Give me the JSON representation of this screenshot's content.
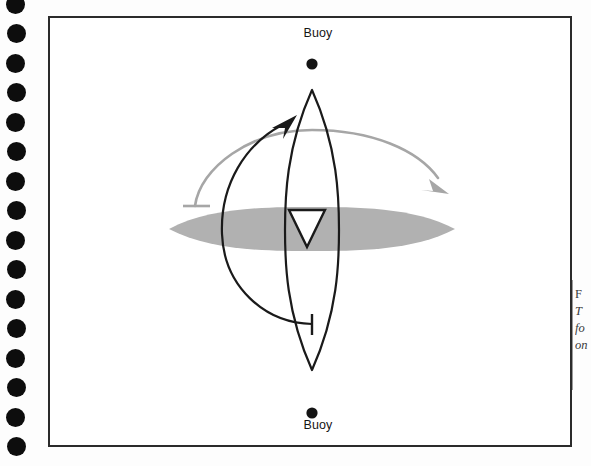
{
  "page": {
    "background_color": "#fdfdfd",
    "binding": {
      "name": "spiral-binding-holes",
      "hole_color": "#0d0d0d",
      "hole_count": 16,
      "hole_diameter_px": 19,
      "hole_spacing_px": 29.5,
      "first_hole_center_y": 4
    }
  },
  "figure": {
    "frame": {
      "border_color": "#2b2b2b",
      "border_width_px": 2,
      "fill": "#ffffff",
      "x": 48,
      "y": 16,
      "width": 524,
      "height": 431
    },
    "labels": {
      "buoy_top": "Buoy",
      "buoy_bottom": "Buoy"
    },
    "colors": {
      "ink_black": "#1a1a1a",
      "wind_arrow_gray": "#a6a6a6",
      "water_gray": "#b1b1b1",
      "hull_outline": "#1a1a1a"
    }
  },
  "scene": {
    "buoy_top_marker": {
      "name": "buoy-marker-top",
      "cx": 262,
      "cy": 46,
      "r": 5.5,
      "color": "#141414"
    },
    "buoy_bottom_marker": {
      "name": "buoy-marker-bottom",
      "cx": 262,
      "cy": 395,
      "r": 5.5,
      "color": "#141414"
    },
    "water_lens": {
      "name": "water-surface-ellipse",
      "description": "horizontal grey lens representing the water / course plane",
      "cx": 262,
      "cy": 211,
      "half_width": 143,
      "half_height": 22,
      "fill": "#b1b1b1"
    },
    "hull": {
      "name": "boat-hull-vertical-lens",
      "description": "tall vertical lens shape representing the boat hull / course line",
      "cx": 262,
      "cy": 212,
      "half_width": 27,
      "half_height": 140,
      "stroke": "#1a1a1a",
      "stroke_width": 2.2,
      "fill": "none"
    },
    "sail_triangle": {
      "name": "sail-triangle",
      "description": "downward-pointing triangle representing the sail",
      "points": "239,192 275,192 257,228",
      "stroke": "#1a1a1a",
      "stroke_width": 2.4,
      "fill": "#ffffff"
    },
    "black_arc": {
      "name": "black-rounding-arc",
      "description": "black arc sweeping from lower-right tick up and over to upper-left arrowhead",
      "stroke": "#1a1a1a",
      "stroke_width": 2.2,
      "arrowhead": "upper-left-pointing-up-right",
      "tail_tick": "T-bar at lower end"
    },
    "gray_arc": {
      "name": "gray-wind-arc",
      "description": "gray arc sweeping from left tick over the top to a right-side arrowhead",
      "stroke": "#a6a6a6",
      "stroke_width": 2.6,
      "arrowhead": "right-pointing-down-right",
      "tail_tick": "T-bar at left end"
    }
  },
  "caption": {
    "figure_number_fragment": "F",
    "line_fragments": [
      "T",
      "fo",
      "on"
    ]
  }
}
